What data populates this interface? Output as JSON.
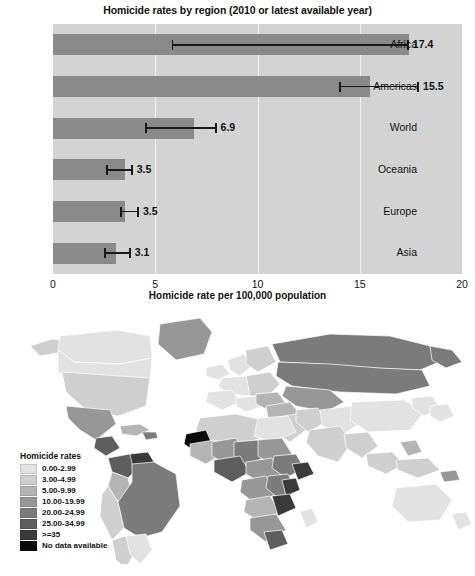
{
  "chart_data": [
    {
      "type": "bar",
      "orientation": "horizontal",
      "title": "Homicide rates by region (2010 or latest available year)",
      "xlabel": "Homicide rate per 100,000 population",
      "ylabel": "",
      "xlim": [
        0,
        20
      ],
      "xticks": [
        0,
        5,
        10,
        15,
        20
      ],
      "xtick_labels": [
        "0",
        "5",
        "10",
        "15",
        "20"
      ],
      "grid": true,
      "legend": "none",
      "categories": [
        "Africa",
        "Americas",
        "World",
        "Oceania",
        "Europe",
        "Asia"
      ],
      "values": [
        17.4,
        15.5,
        6.9,
        3.5,
        3.5,
        3.1
      ],
      "value_labels": [
        "17.4",
        "15.5",
        "6.9",
        "3.5",
        "3.5",
        "3.1"
      ],
      "error_low": [
        5.8,
        14.0,
        4.5,
        2.6,
        3.3,
        2.5
      ],
      "error_high": [
        17.4,
        17.9,
        8.0,
        3.9,
        4.2,
        3.8
      ],
      "bar_color": "#8a8a8a",
      "plot_background": "#d3d3d3",
      "gridline_color": "#f2f2f2"
    },
    {
      "type": "choropleth",
      "title": "",
      "legend_title": "Homicide rates",
      "legend_position": "lower-left",
      "bins": [
        {
          "label": "0.00-2.99",
          "color": "#e2e2e2"
        },
        {
          "label": "3.00-4.99",
          "color": "#cfcfcf"
        },
        {
          "label": "5.00-9.99",
          "color": "#b4b4b4"
        },
        {
          "label": "10.00-19.99",
          "color": "#979797"
        },
        {
          "label": "20.00-24.99",
          "color": "#7b7b7b"
        },
        {
          "label": "25.00-34.99",
          "color": "#5e5e5e"
        },
        {
          "label": ">=35",
          "color": "#3a3a3a"
        },
        {
          "label": "No data available",
          "color": "#0a0a0a"
        }
      ],
      "ocean_color": "#ffffff"
    }
  ],
  "bar_chart": {
    "title": "Homicide rates by region (2010 or latest available year)",
    "xaxis_title": "Homicide rate per 100,000 population",
    "xticks": [
      "0",
      "5",
      "10",
      "15",
      "20"
    ],
    "rows": [
      {
        "label": "Africa",
        "value_label": "17.4"
      },
      {
        "label": "Americas",
        "value_label": "15.5"
      },
      {
        "label": "World",
        "value_label": "6.9"
      },
      {
        "label": "Oceania",
        "value_label": "3.5"
      },
      {
        "label": "Europe",
        "value_label": "3.5"
      },
      {
        "label": "Asia",
        "value_label": "3.1"
      }
    ]
  },
  "map": {
    "legend_title": "Homicide rates",
    "legend": [
      {
        "label": "0.00-2.99"
      },
      {
        "label": "3.00-4.99"
      },
      {
        "label": "5.00-9.99"
      },
      {
        "label": "10.00-19.99"
      },
      {
        "label": "20.00-24.99"
      },
      {
        "label": "25.00-34.99"
      },
      {
        "label": ">=35"
      },
      {
        "label": "No data available"
      }
    ],
    "caption": ""
  }
}
